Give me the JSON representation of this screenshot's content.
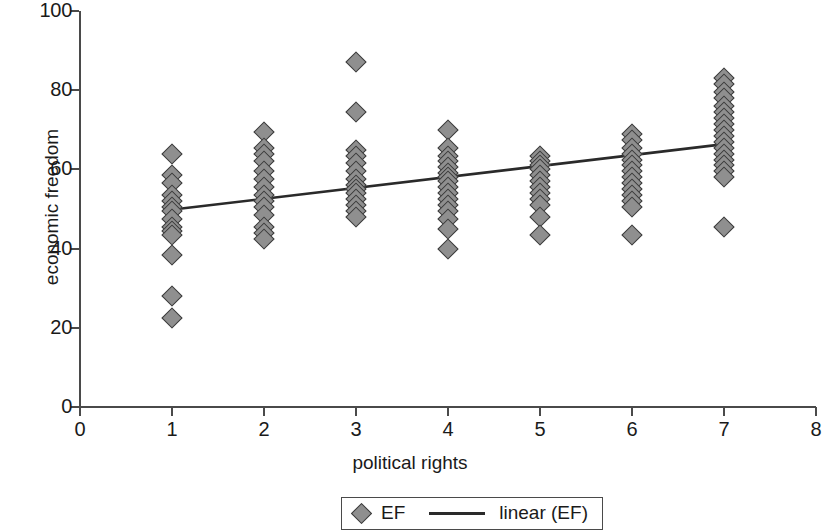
{
  "chart_data": {
    "type": "scatter",
    "title": "",
    "xlabel": "political rights",
    "ylabel": "economic freedom",
    "xlim": [
      0,
      8
    ],
    "ylim": [
      0,
      100
    ],
    "xticks": [
      0,
      1,
      2,
      3,
      4,
      5,
      6,
      7,
      8
    ],
    "yticks": [
      0,
      20,
      40,
      60,
      80,
      100
    ],
    "grid": false,
    "legend_position": "bottom-center",
    "legend": [
      {
        "label": "EF",
        "marker": "diamond",
        "color": "#8f8f8f"
      },
      {
        "label": "linear (EF)",
        "marker": "line",
        "color": "#2a2a2a"
      }
    ],
    "series": [
      {
        "name": "EF",
        "marker": "diamond",
        "points": [
          [
            1,
            64.0
          ],
          [
            1,
            58.5
          ],
          [
            1,
            56.5
          ],
          [
            1,
            53.5
          ],
          [
            1,
            52.0
          ],
          [
            1,
            50.5
          ],
          [
            1,
            49.5
          ],
          [
            1,
            47.5
          ],
          [
            1,
            45.5
          ],
          [
            1,
            44.5
          ],
          [
            1,
            43.5
          ],
          [
            1,
            38.5
          ],
          [
            1,
            28.0
          ],
          [
            1,
            22.5
          ],
          [
            2,
            69.5
          ],
          [
            2,
            65.5
          ],
          [
            2,
            64.0
          ],
          [
            2,
            62.0
          ],
          [
            2,
            59.5
          ],
          [
            2,
            57.5
          ],
          [
            2,
            55.5
          ],
          [
            2,
            53.5
          ],
          [
            2,
            52.0
          ],
          [
            2,
            50.5
          ],
          [
            2,
            48.5
          ],
          [
            2,
            45.5
          ],
          [
            2,
            44.0
          ],
          [
            2,
            42.5
          ],
          [
            3,
            87.0
          ],
          [
            3,
            74.5
          ],
          [
            3,
            65.0
          ],
          [
            3,
            63.5
          ],
          [
            3,
            61.5
          ],
          [
            3,
            59.5
          ],
          [
            3,
            57.5
          ],
          [
            3,
            56.0
          ],
          [
            3,
            55.0
          ],
          [
            3,
            54.0
          ],
          [
            3,
            52.5
          ],
          [
            3,
            51.0
          ],
          [
            3,
            49.5
          ],
          [
            3,
            48.0
          ],
          [
            4,
            70.0
          ],
          [
            4,
            65.5
          ],
          [
            4,
            63.5
          ],
          [
            4,
            62.0
          ],
          [
            4,
            60.5
          ],
          [
            4,
            59.0
          ],
          [
            4,
            58.0
          ],
          [
            4,
            57.0
          ],
          [
            4,
            55.5
          ],
          [
            4,
            54.0
          ],
          [
            4,
            52.5
          ],
          [
            4,
            51.0
          ],
          [
            4,
            49.5
          ],
          [
            4,
            47.5
          ],
          [
            4,
            45.0
          ],
          [
            4,
            40.0
          ],
          [
            5,
            63.5
          ],
          [
            5,
            62.0
          ],
          [
            5,
            61.0
          ],
          [
            5,
            60.0
          ],
          [
            5,
            58.5
          ],
          [
            5,
            57.0
          ],
          [
            5,
            55.5
          ],
          [
            5,
            54.0
          ],
          [
            5,
            52.5
          ],
          [
            5,
            51.0
          ],
          [
            5,
            48.0
          ],
          [
            5,
            43.5
          ],
          [
            6,
            69.0
          ],
          [
            6,
            67.5
          ],
          [
            6,
            65.5
          ],
          [
            6,
            64.0
          ],
          [
            6,
            62.5
          ],
          [
            6,
            61.0
          ],
          [
            6,
            59.5
          ],
          [
            6,
            58.0
          ],
          [
            6,
            56.5
          ],
          [
            6,
            55.0
          ],
          [
            6,
            53.5
          ],
          [
            6,
            52.0
          ],
          [
            6,
            50.5
          ],
          [
            6,
            43.5
          ],
          [
            7,
            83.0
          ],
          [
            7,
            81.5
          ],
          [
            7,
            79.5
          ],
          [
            7,
            78.0
          ],
          [
            7,
            76.0
          ],
          [
            7,
            74.5
          ],
          [
            7,
            73.0
          ],
          [
            7,
            71.5
          ],
          [
            7,
            70.0
          ],
          [
            7,
            68.5
          ],
          [
            7,
            67.0
          ],
          [
            7,
            65.5
          ],
          [
            7,
            64.0
          ],
          [
            7,
            62.5
          ],
          [
            7,
            61.0
          ],
          [
            7,
            59.5
          ],
          [
            7,
            58.0
          ],
          [
            7,
            45.5
          ]
        ]
      }
    ],
    "trendline": {
      "name": "linear (EF)",
      "x_start": 0.92,
      "y_start": 49.6,
      "x_end": 7.05,
      "y_end": 66.5,
      "color": "#2a2a2a"
    }
  }
}
